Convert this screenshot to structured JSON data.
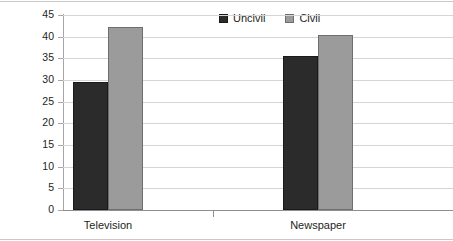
{
  "chart_data": {
    "type": "bar",
    "title": "",
    "subtitle": "",
    "xlabel": "",
    "ylabel": "",
    "categories": [
      "Television",
      "Newspaper"
    ],
    "series": [
      {
        "name": "Uncivil",
        "values": [
          29.5,
          35.5
        ],
        "color": "#2b2b2b"
      },
      {
        "name": "Civil",
        "values": [
          42.3,
          40.3
        ],
        "color": "#9b9b9b"
      }
    ],
    "ylim": [
      0,
      45
    ],
    "ytick_labels": [
      "0",
      "5",
      "10",
      "15",
      "20",
      "25",
      "30",
      "35",
      "40",
      "45"
    ],
    "ytick_values": [
      0,
      5,
      10,
      15,
      20,
      25,
      30,
      35,
      40,
      45
    ],
    "grid": true,
    "grid_axis": "y",
    "legend": {
      "position": "top-center",
      "entries": [
        {
          "label": "Uncivil",
          "swatch": "uncivil"
        },
        {
          "label": "Civil",
          "swatch": "civil"
        }
      ]
    },
    "annotations": []
  },
  "colors": {
    "uncivil": "#2b2b2b",
    "civil": "#9b9b9b",
    "gridline": "#d5d5d5",
    "axis": "#8f8f8f",
    "frame": "#c9c9c9",
    "text": "#231f20",
    "background": "#ffffff"
  }
}
